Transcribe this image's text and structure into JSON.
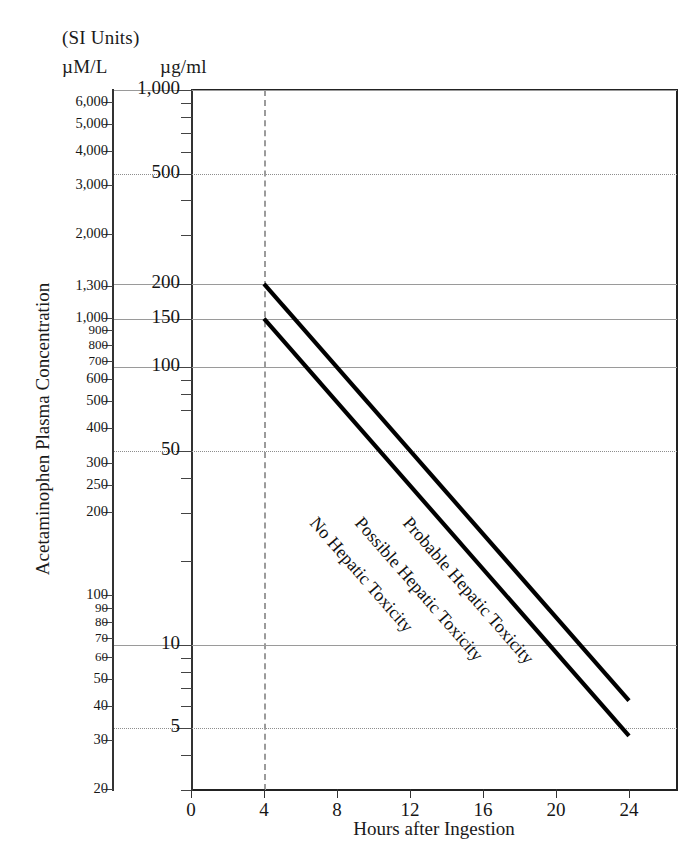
{
  "header": {
    "si_units": "(SI Units)",
    "unit_left": "µM/L",
    "unit_right": "µg/ml"
  },
  "axes": {
    "ylabel": "Acetaminophen Plasma Concentration",
    "xlabel": "Hours after Ingestion",
    "caption": ""
  },
  "chart_data": {
    "type": "line",
    "xlabel": "Hours after Ingestion",
    "ylabel": "Acetaminophen Plasma Concentration",
    "y_scale": "log",
    "x_scale": "linear",
    "xlim": [
      -1.5,
      26.5
    ],
    "ylim_ug_ml": [
      3,
      1000
    ],
    "grid": "horizontal gridlines, dashed vertical marker at 4 hours",
    "legend": "inline diagonal labels on the plot",
    "x_ticks": [
      0,
      4,
      8,
      12,
      16,
      20,
      24
    ],
    "y_ticks_ug_ml": [
      {
        "value": 1000,
        "label": "1,000",
        "grid": "solid"
      },
      {
        "value": 900,
        "label": "",
        "grid": "none"
      },
      {
        "value": 800,
        "label": "",
        "grid": "none"
      },
      {
        "value": 700,
        "label": "",
        "grid": "none"
      },
      {
        "value": 600,
        "label": "",
        "grid": "none"
      },
      {
        "value": 500,
        "label": "500",
        "grid": "dotted"
      },
      {
        "value": 400,
        "label": "",
        "grid": "none"
      },
      {
        "value": 300,
        "label": "",
        "grid": "none"
      },
      {
        "value": 200,
        "label": "200",
        "grid": "solid"
      },
      {
        "value": 150,
        "label": "150",
        "grid": "solid"
      },
      {
        "value": 100,
        "label": "100",
        "grid": "solid"
      },
      {
        "value": 90,
        "label": "",
        "grid": "none"
      },
      {
        "value": 80,
        "label": "",
        "grid": "none"
      },
      {
        "value": 70,
        "label": "",
        "grid": "none"
      },
      {
        "value": 50,
        "label": "50",
        "grid": "dotted"
      },
      {
        "value": 40,
        "label": "",
        "grid": "none"
      },
      {
        "value": 30,
        "label": "",
        "grid": "none"
      },
      {
        "value": 20,
        "label": "",
        "grid": "none"
      },
      {
        "value": 10,
        "label": "10",
        "grid": "solid"
      },
      {
        "value": 9,
        "label": "",
        "grid": "none"
      },
      {
        "value": 8,
        "label": "",
        "grid": "none"
      },
      {
        "value": 7,
        "label": "",
        "grid": "none"
      },
      {
        "value": 6,
        "label": "",
        "grid": "none"
      },
      {
        "value": 5,
        "label": "5",
        "grid": "dotted"
      },
      {
        "value": 4,
        "label": "",
        "grid": "none"
      },
      {
        "value": 3,
        "label": "",
        "grid": "none"
      }
    ],
    "y_ticks_um_l": [
      {
        "value": 6000,
        "label": "6,000"
      },
      {
        "value": 5000,
        "label": "5,000"
      },
      {
        "value": 4000,
        "label": "4,000"
      },
      {
        "value": 3000,
        "label": "3,000"
      },
      {
        "value": 2000,
        "label": "2,000"
      },
      {
        "value": 1300,
        "label": "1,300"
      },
      {
        "value": 1000,
        "label": "1,000"
      },
      {
        "value": 900,
        "label": "900"
      },
      {
        "value": 800,
        "label": "800"
      },
      {
        "value": 700,
        "label": "700"
      },
      {
        "value": 600,
        "label": "600"
      },
      {
        "value": 500,
        "label": "500"
      },
      {
        "value": 400,
        "label": "400"
      },
      {
        "value": 300,
        "label": "300"
      },
      {
        "value": 250,
        "label": "250"
      },
      {
        "value": 200,
        "label": "200"
      },
      {
        "value": 100,
        "label": "100"
      },
      {
        "value": 90,
        "label": "90"
      },
      {
        "value": 80,
        "label": "80"
      },
      {
        "value": 70,
        "label": "70"
      },
      {
        "value": 60,
        "label": "60"
      },
      {
        "value": 50,
        "label": "50"
      },
      {
        "value": 40,
        "label": "40"
      },
      {
        "value": 30,
        "label": "30"
      },
      {
        "value": 20,
        "label": "20"
      },
      {
        "value": 10,
        "label": "10"
      }
    ],
    "vertical_marker_hours": 4,
    "series": [
      {
        "name": "Probable Hepatic Toxicity line",
        "label": "Probable Hepatic Toxicity",
        "points": [
          {
            "x": 4,
            "y_ug_ml": 200
          },
          {
            "x": 24,
            "y_ug_ml": 6.3
          }
        ],
        "style": "solid thick black"
      },
      {
        "name": "Possible Hepatic Toxicity line",
        "label": "Possible Hepatic Toxicity",
        "points": [
          {
            "x": 4,
            "y_ug_ml": 150
          },
          {
            "x": 24,
            "y_ug_ml": 4.7
          }
        ],
        "style": "solid thick black"
      }
    ],
    "zone_labels": [
      {
        "text": "Probable Hepatic Toxicity",
        "region": "above upper line"
      },
      {
        "text": "Possible Hepatic Toxicity",
        "region": "between the two lines"
      },
      {
        "text": "No Hepatic Toxicity",
        "region": "below lower line"
      }
    ]
  }
}
